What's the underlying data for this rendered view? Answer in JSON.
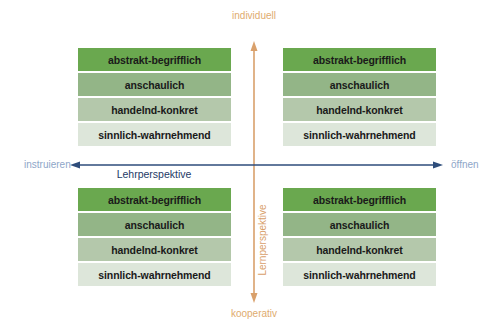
{
  "axes": {
    "vertical": {
      "top_label": "individuell",
      "bottom_label": "kooperativ",
      "axis_title": "Lernperspektive",
      "color": "#d9a06b"
    },
    "horizontal": {
      "left_label": "instruieren",
      "right_label": "öffnen",
      "axis_title": "Lehrperspektive",
      "color": "#2e4d7b"
    }
  },
  "band_colors": [
    "#6aa84f",
    "#93b587",
    "#b4c8ab",
    "#dde6da"
  ],
  "quadrants": {
    "top_left": {
      "bands": [
        "abstrakt-begrifflich",
        "anschaulich",
        "handelnd-konkret",
        "sinnlich-wahrnehmend"
      ]
    },
    "top_right": {
      "bands": [
        "abstrakt-begrifflich",
        "anschaulich",
        "handelnd-konkret",
        "sinnlich-wahrnehmend"
      ]
    },
    "bottom_left": {
      "bands": [
        "abstrakt-begrifflich",
        "anschaulich",
        "handelnd-konkret",
        "sinnlich-wahrnehmend"
      ]
    },
    "bottom_right": {
      "bands": [
        "abstrakt-begrifflich",
        "anschaulich",
        "handelnd-konkret",
        "sinnlich-wahrnehmend"
      ]
    }
  }
}
